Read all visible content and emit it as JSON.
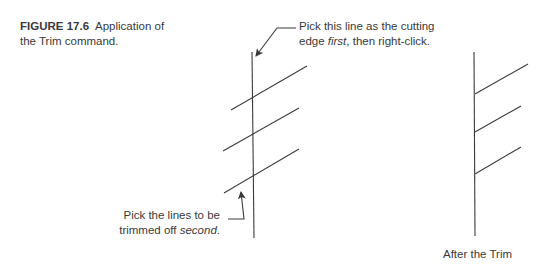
{
  "caption": {
    "figure_label": "FIGURE 17.6",
    "text_line1": "Application of",
    "text_line2": "the Trim command."
  },
  "annotations": {
    "top": {
      "line1": "Pick this line as the cutting",
      "line2_pre": "edge ",
      "line2_em": "first",
      "line2_post": ", then right-click."
    },
    "bottom": {
      "line1": "Pick the lines to be",
      "line2_pre": "trimmed off ",
      "line2_em": "second",
      "line2_post": "."
    }
  },
  "after_label": "After the Trim",
  "colors": {
    "line": "#3a3a3a",
    "background": "#ffffff"
  }
}
